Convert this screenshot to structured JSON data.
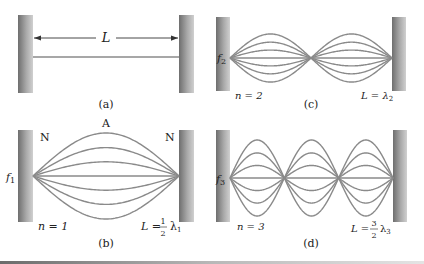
{
  "figure": {
    "colors": {
      "wall_dark": "#6e6e6e",
      "wall_light": "#c8c8c8",
      "string": "#8a8a8a",
      "text": "#222222"
    },
    "panels": [
      {
        "id": "a",
        "caption": "(a)",
        "length_label": "L",
        "mode_number": null,
        "shows": "string at rest with length L indicated by a double arrow"
      },
      {
        "id": "b",
        "caption": "(b)",
        "freq_label": "f",
        "freq_sub": "1",
        "n_label": "n = 1",
        "relation_lhs": "L =",
        "relation_num": "1",
        "relation_den": "2",
        "relation_lambda": "λ",
        "relation_sub": "1",
        "node_label": "N",
        "antinode_label": "A",
        "loops": 1
      },
      {
        "id": "c",
        "caption": "(c)",
        "freq_label": "f",
        "freq_sub": "2",
        "n_label": "n = 2",
        "relation_lhs": "L = λ",
        "relation_sub": "2",
        "loops": 2
      },
      {
        "id": "d",
        "caption": "(d)",
        "freq_label": "f",
        "freq_sub": "3",
        "n_label": "n = 3",
        "relation_lhs": "L =",
        "relation_num": "3",
        "relation_den": "2",
        "relation_lambda": "λ",
        "relation_sub": "3",
        "loops": 3
      }
    ]
  }
}
